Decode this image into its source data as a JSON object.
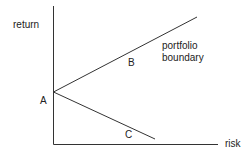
{
  "diagram": {
    "type": "risk-return portfolio boundary",
    "colors": {
      "line": "#333333",
      "text": "#222222",
      "background": "#ffffff"
    },
    "axes": {
      "y_label": "return",
      "x_label": "risk"
    },
    "points": {
      "A": "A",
      "B": "B",
      "C": "C"
    },
    "boundary_label_line1": "portfolio",
    "boundary_label_line2": "boundary"
  }
}
